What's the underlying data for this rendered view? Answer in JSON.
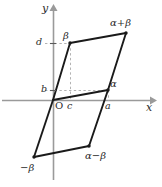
{
  "figure": {
    "type": "complex-plane-parallelogram",
    "width": 162,
    "height": 187,
    "colors": {
      "axis": "#9a9a9a",
      "shape": "#1a1a1a",
      "dashed": "#b0b0b0",
      "text": "#2b2b2b",
      "background": "#ffffff"
    },
    "axes": {
      "x_label": "x",
      "y_label": "y",
      "origin_label": "O",
      "origin": {
        "x": 53,
        "y": 100
      }
    },
    "points": [
      {
        "name": "origin",
        "label": "O",
        "x": 53,
        "y": 100
      },
      {
        "name": "alpha",
        "label": "α",
        "x": 108,
        "y": 90
      },
      {
        "name": "beta",
        "label": "β",
        "x": 70,
        "y": 43
      },
      {
        "name": "alpha-plus-beta",
        "label": "α+β",
        "x": 126,
        "y": 33
      },
      {
        "name": "minus-beta",
        "label": "−β",
        "x": 34,
        "y": 157
      },
      {
        "name": "alpha-minus-beta",
        "label": "α−β",
        "x": 89,
        "y": 146
      }
    ],
    "ticks": [
      {
        "name": "tick-a",
        "label": "a",
        "axis": "x",
        "x": 108,
        "y": 100
      },
      {
        "name": "tick-c",
        "label": "c",
        "axis": "x",
        "x": 70,
        "y": 100
      },
      {
        "name": "tick-b",
        "label": "b",
        "axis": "y",
        "x": 53,
        "y": 90
      },
      {
        "name": "tick-d",
        "label": "d",
        "axis": "y",
        "x": 53,
        "y": 43
      }
    ],
    "labels": {
      "y_axis": "y",
      "x_axis": "x",
      "origin": "O",
      "alpha": "α",
      "beta": "β",
      "alpha_plus_beta": "α+β",
      "alpha_minus_beta": "α−β",
      "minus_beta": "−β",
      "tick_a": "a",
      "tick_b": "b",
      "tick_c": "c",
      "tick_d": "d"
    }
  }
}
